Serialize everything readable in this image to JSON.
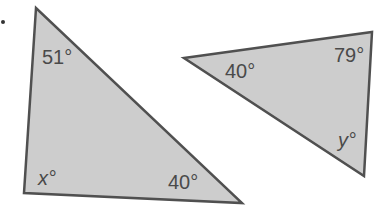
{
  "figure": {
    "colors": {
      "fill": "#cdcdcd",
      "stroke": "#505050",
      "text": "#4a4a4a",
      "background": "#ffffff"
    },
    "triangles": [
      {
        "id": "left-triangle",
        "vertices": [
          [
            36,
            8
          ],
          [
            24,
            193
          ],
          [
            242,
            203
          ]
        ],
        "angles": [
          {
            "label": "51°",
            "x": 42,
            "y": 64
          },
          {
            "label": "x°",
            "x": 38,
            "y": 185,
            "italic": true
          },
          {
            "label": "40°",
            "x": 168,
            "y": 189
          }
        ]
      },
      {
        "id": "right-triangle",
        "vertices": [
          [
            184,
            58
          ],
          [
            372,
            32
          ],
          [
            364,
            176
          ]
        ],
        "angles": [
          {
            "label": "40°",
            "x": 225,
            "y": 78
          },
          {
            "label": "79°",
            "x": 334,
            "y": 62
          },
          {
            "label": "y°",
            "x": 338,
            "y": 147,
            "italic": true
          }
        ]
      }
    ],
    "bullet": {
      "x": 3,
      "y": 22
    }
  }
}
